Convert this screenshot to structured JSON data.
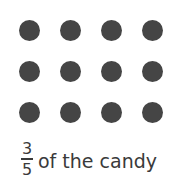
{
  "figure": {
    "dot_color": "#454545",
    "rows": 3,
    "cols": 4,
    "dot_count": 12,
    "dots": [
      {
        "x": 19,
        "y": 20
      },
      {
        "x": 60,
        "y": 20
      },
      {
        "x": 101,
        "y": 20
      },
      {
        "x": 142,
        "y": 20
      },
      {
        "x": 19,
        "y": 61
      },
      {
        "x": 60,
        "y": 61
      },
      {
        "x": 101,
        "y": 61
      },
      {
        "x": 142,
        "y": 61
      },
      {
        "x": 19,
        "y": 102
      },
      {
        "x": 60,
        "y": 102
      },
      {
        "x": 101,
        "y": 102
      },
      {
        "x": 142,
        "y": 102
      }
    ]
  },
  "caption": {
    "numerator": "3",
    "denominator": "5",
    "text": "of the candy"
  }
}
